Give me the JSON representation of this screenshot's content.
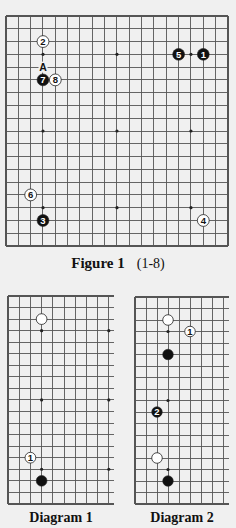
{
  "colors": {
    "page_background": "#f0f0f0",
    "grid_line": "#555555",
    "black_stone": "#111111",
    "white_stone": "#ffffff",
    "star_point": "#222222"
  },
  "figure1": {
    "title": "Figure 1",
    "range": "(1-8)",
    "board": {
      "size": 19,
      "x0": 6,
      "y0": 16,
      "dx": 12.33,
      "dy": 12.78,
      "cols_visible": 19,
      "rows_visible": 19,
      "border": {
        "left": true,
        "right": true,
        "top": true,
        "bottom": true
      },
      "star_points": [
        [
          3,
          3
        ],
        [
          9,
          3
        ],
        [
          15,
          3
        ],
        [
          3,
          9
        ],
        [
          9,
          9
        ],
        [
          15,
          9
        ],
        [
          3,
          15
        ],
        [
          9,
          15
        ],
        [
          15,
          15
        ]
      ]
    },
    "stones": [
      {
        "move": 1,
        "color": "black",
        "col": 16,
        "row": 3
      },
      {
        "move": 2,
        "color": "white",
        "col": 3,
        "row": 2
      },
      {
        "move": 3,
        "color": "black",
        "col": 3,
        "row": 16
      },
      {
        "move": 4,
        "color": "white",
        "col": 16,
        "row": 16
      },
      {
        "move": 5,
        "color": "black",
        "col": 14,
        "row": 3
      },
      {
        "move": 6,
        "color": "white",
        "col": 2,
        "row": 14
      },
      {
        "move": 7,
        "color": "black",
        "col": 3,
        "row": 5
      },
      {
        "move": 8,
        "color": "white",
        "col": 4,
        "row": 5
      }
    ],
    "labels": [
      {
        "text": "A",
        "col": 3,
        "row": 4
      }
    ]
  },
  "diagram1": {
    "title": "Diagram 1",
    "board": {
      "x0": 8,
      "y0": 296,
      "dx": 11.2,
      "dy": 11.55,
      "cols_visible": 10,
      "rows_visible": 19,
      "open_right_extent": 106,
      "border": {
        "left": true,
        "right": false,
        "top": true,
        "bottom": true
      },
      "star_points": [
        [
          3,
          3
        ],
        [
          9,
          3
        ],
        [
          3,
          9
        ],
        [
          9,
          9
        ],
        [
          3,
          15
        ],
        [
          9,
          15
        ]
      ]
    },
    "stones": [
      {
        "move": null,
        "color": "white",
        "col": 3,
        "row": 2
      },
      {
        "move": null,
        "color": "black",
        "col": 3,
        "row": 16
      },
      {
        "move": 1,
        "color": "white",
        "col": 2,
        "row": 14
      }
    ],
    "labels": []
  },
  "diagram2": {
    "title": "Diagram 2",
    "board": {
      "x0": 135,
      "y0": 297,
      "dx": 11.0,
      "dy": 11.5,
      "cols_visible": 9,
      "rows_visible": 19,
      "open_right_extent": 94,
      "border": {
        "left": true,
        "right": false,
        "top": true,
        "bottom": true
      },
      "star_points": [
        [
          3,
          3
        ],
        [
          3,
          9
        ],
        [
          3,
          15
        ]
      ]
    },
    "stones": [
      {
        "move": null,
        "color": "white",
        "col": 3,
        "row": 2
      },
      {
        "move": 1,
        "color": "white",
        "col": 5,
        "row": 3
      },
      {
        "move": null,
        "color": "black",
        "col": 3,
        "row": 5
      },
      {
        "move": 2,
        "color": "black",
        "col": 2,
        "row": 10
      },
      {
        "move": null,
        "color": "white",
        "col": 2,
        "row": 14
      },
      {
        "move": null,
        "color": "black",
        "col": 3,
        "row": 16
      }
    ],
    "labels": []
  }
}
